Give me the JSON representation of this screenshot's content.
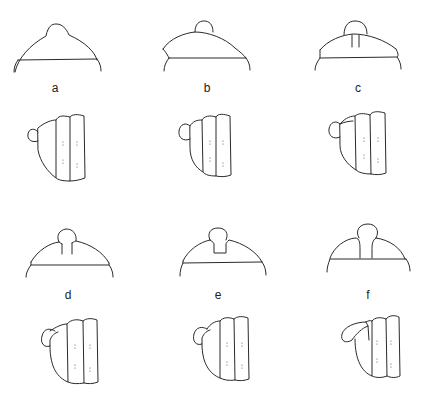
{
  "figure": {
    "panels": [
      {
        "id": "a",
        "label": "a"
      },
      {
        "id": "b",
        "label": "b"
      },
      {
        "id": "c",
        "label": "c"
      },
      {
        "id": "d",
        "label": "d"
      },
      {
        "id": "e",
        "label": "e"
      },
      {
        "id": "f",
        "label": "f"
      }
    ],
    "colors": {
      "line": "#2a2a2a",
      "background": "#ffffff"
    }
  }
}
